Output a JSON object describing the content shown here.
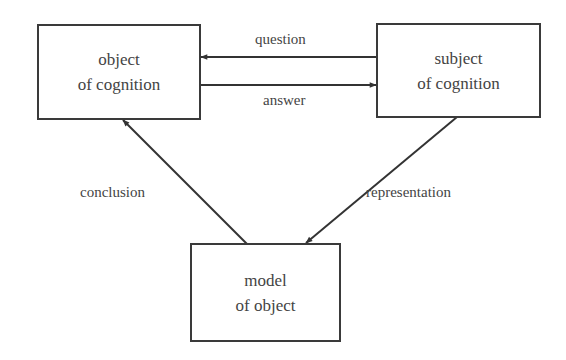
{
  "diagram": {
    "nodes": {
      "object": {
        "line1": "object",
        "line2": "of cognition"
      },
      "subject": {
        "line1": "subject",
        "line2": "of cognition"
      },
      "model": {
        "line1": "model",
        "line2": "of object"
      }
    },
    "edges": {
      "question": "question",
      "answer": "answer",
      "conclusion": "conclusion",
      "representation": "representation"
    }
  }
}
